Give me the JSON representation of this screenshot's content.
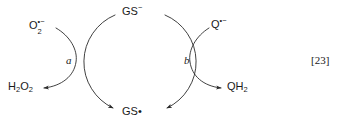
{
  "figure": {
    "kind": "reaction-cycle-scheme",
    "reference": "[23]",
    "stroke_color": "#2b2b2b",
    "text_color": "#1a1a1a",
    "background": "#ffffff"
  },
  "cycle": {
    "top_species": {
      "id": "gs-anion",
      "base": "GS",
      "charge": "−",
      "full": "GS−"
    },
    "bottom_species": {
      "id": "gs-radical",
      "base": "GS",
      "radical": "•",
      "full": "GS•"
    }
  },
  "left_branch": {
    "catalyst": "a",
    "reactant": {
      "id": "superoxide",
      "base": "O",
      "subscript": "2",
      "superscript": "•−",
      "full": "O2•−"
    },
    "product": {
      "id": "hydrogen-peroxide",
      "base_1": "H",
      "subscript_1": "2",
      "base_2": "O",
      "subscript_2": "2",
      "full": "H2O2"
    }
  },
  "right_branch": {
    "catalyst": "b",
    "reactant": {
      "id": "semiquinone",
      "base": "Q",
      "superscript": "•−",
      "full": "Q•−"
    },
    "product": {
      "id": "quinol",
      "base": "QH",
      "subscript": "2",
      "full": "QH2"
    }
  }
}
